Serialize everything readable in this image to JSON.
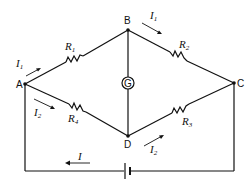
{
  "diagram": {
    "nodes": [
      {
        "id": "A",
        "label": "A"
      },
      {
        "id": "B",
        "label": "B"
      },
      {
        "id": "C",
        "label": "C"
      },
      {
        "id": "D",
        "label": "D"
      }
    ],
    "resistors": [
      {
        "id": "R1",
        "symbol": "R",
        "sub": "1",
        "from": "A",
        "to": "B"
      },
      {
        "id": "R2",
        "symbol": "R",
        "sub": "2",
        "from": "B",
        "to": "C"
      },
      {
        "id": "R3",
        "symbol": "R",
        "sub": "3",
        "from": "D",
        "to": "C"
      },
      {
        "id": "R4",
        "symbol": "R",
        "sub": "4",
        "from": "A",
        "to": "D"
      }
    ],
    "galvanometer": {
      "label": "G",
      "from": "B",
      "to": "D"
    },
    "battery": {
      "label": "battery",
      "between": "A-C bottom wire"
    },
    "currents": [
      {
        "symbol": "I",
        "sub": "1",
        "where": "A to B"
      },
      {
        "symbol": "I",
        "sub": "1",
        "where": "B to C"
      },
      {
        "symbol": "I",
        "sub": "2",
        "where": "A to D"
      },
      {
        "symbol": "I",
        "sub": "2",
        "where": "D to C"
      },
      {
        "symbol": "I",
        "sub": "",
        "where": "bottom wire, right to left"
      }
    ]
  }
}
